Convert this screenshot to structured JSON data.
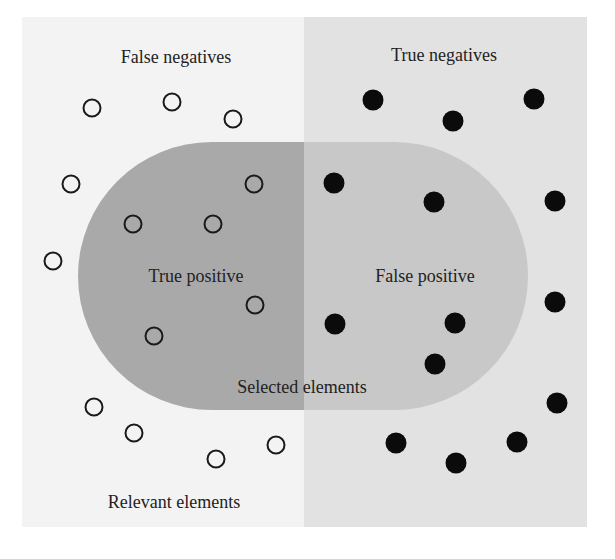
{
  "diagram": {
    "type": "precision-recall-set-diagram",
    "labels": {
      "false_negatives": "False negatives",
      "true_negatives": "True negatives",
      "true_positive": "True positive",
      "false_positive": "False positive",
      "selected_elements": "Selected elements",
      "relevant_elements": "Relevant elements"
    },
    "colors": {
      "background": "#ffffff",
      "relevant_region": "#f3f3f3",
      "irrelevant_region": "#e2e2e2",
      "selected_relevant": "#a9a9a9",
      "selected_irrelevant": "#c8c8c8",
      "text": "#222222",
      "dot": "#0b0b0b"
    },
    "open_dots": [
      {
        "x": 92,
        "y": 108
      },
      {
        "x": 172,
        "y": 102
      },
      {
        "x": 233,
        "y": 119
      },
      {
        "x": 71,
        "y": 184
      },
      {
        "x": 254,
        "y": 184
      },
      {
        "x": 133,
        "y": 224
      },
      {
        "x": 213,
        "y": 224
      },
      {
        "x": 53,
        "y": 261
      },
      {
        "x": 255,
        "y": 305
      },
      {
        "x": 154,
        "y": 336
      },
      {
        "x": 94,
        "y": 407
      },
      {
        "x": 134,
        "y": 433
      },
      {
        "x": 216,
        "y": 459
      },
      {
        "x": 276,
        "y": 445
      }
    ],
    "filled_dots": [
      {
        "x": 373,
        "y": 100
      },
      {
        "x": 453,
        "y": 121
      },
      {
        "x": 534,
        "y": 99
      },
      {
        "x": 334,
        "y": 183
      },
      {
        "x": 434,
        "y": 202
      },
      {
        "x": 555,
        "y": 201
      },
      {
        "x": 555,
        "y": 302
      },
      {
        "x": 335,
        "y": 324
      },
      {
        "x": 455,
        "y": 323
      },
      {
        "x": 435,
        "y": 364
      },
      {
        "x": 557,
        "y": 403
      },
      {
        "x": 396,
        "y": 443
      },
      {
        "x": 456,
        "y": 463
      },
      {
        "x": 517,
        "y": 442
      }
    ]
  }
}
